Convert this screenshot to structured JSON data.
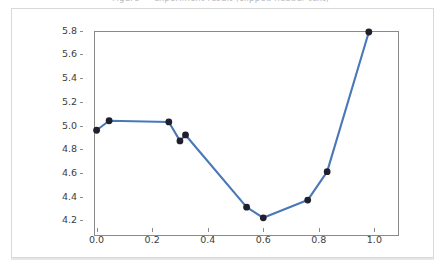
{
  "top_caption": {
    "text": "Figure — experiment result (clipped header text)"
  },
  "chart_data": {
    "type": "line",
    "title": "",
    "xlabel": "",
    "ylabel": "",
    "xlim": [
      -0.049,
      1.049
    ],
    "ylim": [
      4.134,
      5.866
    ],
    "xticks": [
      0.0,
      0.2,
      0.4,
      0.6,
      0.8,
      1.0
    ],
    "xtick_labels": [
      "0.0",
      "0.2",
      "0.4",
      "0.6",
      "0.8",
      "1.0"
    ],
    "yticks": [
      4.2,
      4.4,
      4.6,
      4.8,
      5.0,
      5.2,
      5.4,
      5.6,
      5.8
    ],
    "ytick_labels": [
      "4.2",
      "4.4",
      "4.6",
      "4.8",
      "5.0",
      "5.2",
      "5.4",
      "5.6",
      "5.8"
    ],
    "grid": false,
    "legend": null,
    "line_color": "#4878b8",
    "marker_color": "#1f1f2e",
    "marker": "o",
    "x": [
      0.0,
      0.045,
      0.26,
      0.3,
      0.32,
      0.54,
      0.6,
      0.76,
      0.83,
      0.98
    ],
    "y": [
      4.96,
      5.04,
      5.03,
      4.87,
      4.92,
      4.31,
      4.22,
      4.37,
      4.61,
      5.79
    ],
    "series": [
      {
        "name": "series-1",
        "x": [
          0.0,
          0.045,
          0.26,
          0.3,
          0.32,
          0.54,
          0.6,
          0.76,
          0.83,
          0.98
        ],
        "values": [
          4.96,
          5.04,
          5.03,
          4.87,
          4.92,
          4.31,
          4.22,
          4.37,
          4.61,
          5.79
        ]
      }
    ]
  },
  "colors": {
    "line": "#4878b8",
    "marker": "#1f1f2e",
    "axis": "#8a8a8a",
    "card_border": "#d8d8d8",
    "tick_text": "#3d3d3d"
  }
}
